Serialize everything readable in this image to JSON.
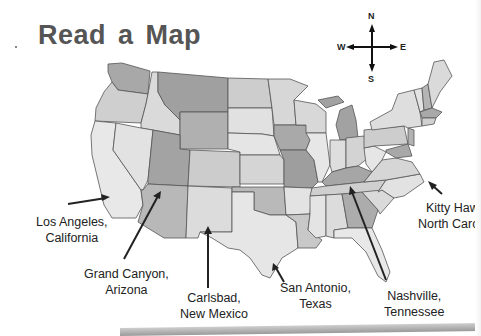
{
  "page": {
    "title": "Read a Map"
  },
  "compass": {
    "north": "N",
    "south": "S",
    "east": "E",
    "west": "W"
  },
  "labels": [
    {
      "id": "los-angeles",
      "line1": "Los Angeles,",
      "line2": "California"
    },
    {
      "id": "grand-canyon",
      "line1": "Grand Canyon,",
      "line2": "Arizona"
    },
    {
      "id": "carlsbad",
      "line1": "Carlsbad,",
      "line2": "New Mexico"
    },
    {
      "id": "san-antonio",
      "line1": "San Antonio,",
      "line2": "Texas"
    },
    {
      "id": "nashville",
      "line1": "Nashville,",
      "line2": "Tennessee"
    },
    {
      "id": "kitty-hawk",
      "line1": "Kitty Haw",
      "line2": "North Carc"
    }
  ],
  "colors": {
    "light": "#e6e6e6",
    "medium_light": "#d2d2d2",
    "medium": "#bdbdbd",
    "dark": "#9a9a9a",
    "border": "#555555",
    "text": "#222222",
    "title": "#555555"
  }
}
